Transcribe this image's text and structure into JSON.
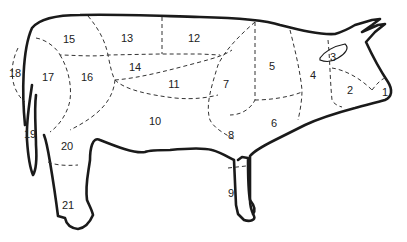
{
  "diagram": {
    "line_color": "#1a1a1a",
    "background": "#ffffff",
    "labels": [
      {
        "id": "1",
        "x": 385,
        "y": 92
      },
      {
        "id": "2",
        "x": 350,
        "y": 90
      },
      {
        "id": "3",
        "x": 333,
        "y": 57
      },
      {
        "id": "4",
        "x": 313,
        "y": 75
      },
      {
        "id": "5",
        "x": 272,
        "y": 66
      },
      {
        "id": "6",
        "x": 274,
        "y": 123
      },
      {
        "id": "7",
        "x": 226,
        "y": 84
      },
      {
        "id": "8",
        "x": 231,
        "y": 135
      },
      {
        "id": "9",
        "x": 231,
        "y": 193
      },
      {
        "id": "10",
        "x": 155,
        "y": 121
      },
      {
        "id": "11",
        "x": 174,
        "y": 84
      },
      {
        "id": "12",
        "x": 194,
        "y": 38
      },
      {
        "id": "13",
        "x": 127,
        "y": 38
      },
      {
        "id": "14",
        "x": 135,
        "y": 67
      },
      {
        "id": "15",
        "x": 69,
        "y": 39
      },
      {
        "id": "16",
        "x": 87,
        "y": 77
      },
      {
        "id": "17",
        "x": 48,
        "y": 77
      },
      {
        "id": "18",
        "x": 15,
        "y": 73
      },
      {
        "id": "19",
        "x": 30,
        "y": 134
      },
      {
        "id": "20",
        "x": 67,
        "y": 146
      },
      {
        "id": "21",
        "x": 68,
        "y": 205
      }
    ]
  }
}
